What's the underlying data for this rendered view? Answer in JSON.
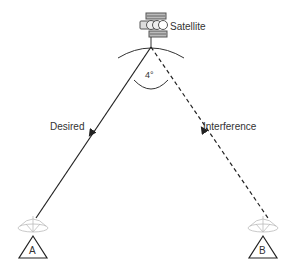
{
  "diagram": {
    "satellite": {
      "label": "Satellite",
      "icon": "satellite-icon"
    },
    "angle": {
      "label": "4°"
    },
    "paths": [
      {
        "name": "desired",
        "label": "Desired",
        "style": "solid",
        "color": "#222222"
      },
      {
        "name": "interference",
        "label": "Interference",
        "style": "dashed",
        "color": "#222222"
      }
    ],
    "stations": [
      {
        "name": "station-a",
        "label": "A",
        "icon": "dish-antenna-icon"
      },
      {
        "name": "station-b",
        "label": "B",
        "icon": "dish-antenna-icon"
      }
    ]
  }
}
